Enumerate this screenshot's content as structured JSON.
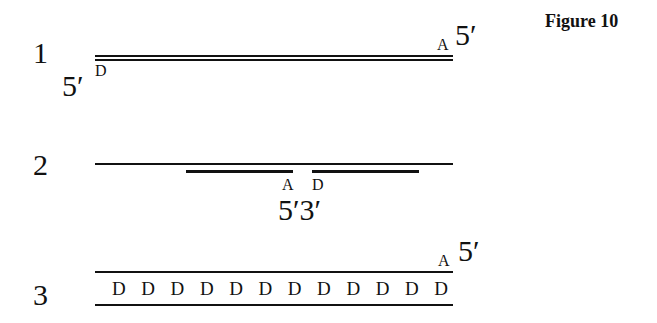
{
  "figure": {
    "title": "Figure 10"
  },
  "panels": [
    {
      "number": "1",
      "left_end_label": "5′",
      "left_base": "D",
      "right_base": "A",
      "right_end_label": "5′",
      "description": "Double-stranded line with D at left 5' end and A at right 5' end"
    },
    {
      "number": "2",
      "left_base": "A",
      "right_base": "D",
      "bottom_labels": "5′3′",
      "description": "Long top strand with two shorter lower segments separated by a gap, A on left segment end, D on right segment start"
    },
    {
      "number": "3",
      "right_base": "A",
      "right_end_label": "5′",
      "d_bases": [
        "D",
        "D",
        "D",
        "D",
        "D",
        "D",
        "D",
        "D",
        "D",
        "D",
        "D",
        "D"
      ],
      "description": "Two parallel strands with a row of 12 D bases between them"
    }
  ],
  "colors": {
    "ink": "#111111",
    "background": "#ffffff"
  }
}
